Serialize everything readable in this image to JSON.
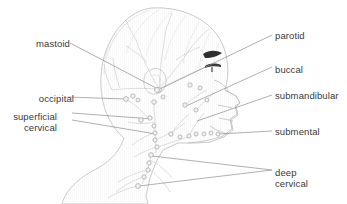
{
  "figure": {
    "background_color": "#ffffff",
    "line_color": "#b4b4b4",
    "leader_color": "#8e8e8e",
    "text_color": "#3a3a3a",
    "node_fill": "#f2f2f2",
    "node_stroke": "#a8a8a8",
    "dark_accent_color": "#2b2b2b"
  },
  "labels": {
    "left": [
      {
        "id": "mastoid",
        "text": "mastoid",
        "x": 18,
        "y": 39,
        "align": "right",
        "lines": [
          "mastoid"
        ]
      },
      {
        "id": "occipital",
        "text": "occipital",
        "x": 22,
        "y": 94,
        "align": "right",
        "lines": [
          "occipital"
        ]
      },
      {
        "id": "superficial-cervical",
        "text": "superficial cervical",
        "x": 5,
        "y": 112,
        "align": "right",
        "lines": [
          "superficial",
          "cervical"
        ]
      }
    ],
    "right": [
      {
        "id": "parotid",
        "text": "parotid",
        "x": 275,
        "y": 31,
        "align": "left",
        "lines": [
          "parotid"
        ]
      },
      {
        "id": "buccal",
        "text": "buccal",
        "x": 275,
        "y": 65,
        "align": "left",
        "lines": [
          "buccal"
        ]
      },
      {
        "id": "submandibular",
        "text": "submandibular",
        "x": 275,
        "y": 91,
        "align": "left",
        "lines": [
          "submandibular"
        ]
      },
      {
        "id": "submental",
        "text": "submental",
        "x": 275,
        "y": 127,
        "align": "left",
        "lines": [
          "submental"
        ]
      },
      {
        "id": "deep-cervical",
        "text": "deep cervical",
        "x": 275,
        "y": 168,
        "align": "left",
        "lines": [
          "deep",
          "cervical"
        ]
      }
    ]
  },
  "node_groups": [
    {
      "name": "parotid",
      "nodes": [
        {
          "cx": 159,
          "cy": 90,
          "r": 2.4
        },
        {
          "cx": 163,
          "cy": 97,
          "r": 2.0
        },
        {
          "cx": 190,
          "cy": 85,
          "r": 2.2
        },
        {
          "cx": 200,
          "cy": 88,
          "r": 2.0
        }
      ]
    },
    {
      "name": "mastoid",
      "nodes": [
        {
          "cx": 157,
          "cy": 90,
          "r": 2.5
        },
        {
          "cx": 154,
          "cy": 102,
          "r": 2.3
        }
      ]
    },
    {
      "name": "occipital",
      "nodes": [
        {
          "cx": 126,
          "cy": 99,
          "r": 2.4
        },
        {
          "cx": 133,
          "cy": 96,
          "r": 2.2
        },
        {
          "cx": 138,
          "cy": 100,
          "r": 2.0
        }
      ]
    },
    {
      "name": "superficial-cervical",
      "nodes": [
        {
          "cx": 141,
          "cy": 120,
          "r": 2.3
        },
        {
          "cx": 150,
          "cy": 118,
          "r": 2.2
        },
        {
          "cx": 154,
          "cy": 126,
          "r": 2.1
        },
        {
          "cx": 155,
          "cy": 133,
          "r": 2.1
        },
        {
          "cx": 155,
          "cy": 140,
          "r": 2.1
        },
        {
          "cx": 157,
          "cy": 147,
          "r": 2.1
        }
      ]
    },
    {
      "name": "buccal",
      "nodes": [
        {
          "cx": 185,
          "cy": 105,
          "r": 2.2
        },
        {
          "cx": 196,
          "cy": 110,
          "r": 2.1
        },
        {
          "cx": 207,
          "cy": 100,
          "r": 2.0
        }
      ]
    },
    {
      "name": "submandibular",
      "nodes": [
        {
          "cx": 171,
          "cy": 134,
          "r": 2.2
        },
        {
          "cx": 180,
          "cy": 137,
          "r": 2.1
        },
        {
          "cx": 189,
          "cy": 136,
          "r": 2.1
        },
        {
          "cx": 196,
          "cy": 134,
          "r": 2.0
        }
      ]
    },
    {
      "name": "submental",
      "nodes": [
        {
          "cx": 204,
          "cy": 134,
          "r": 2.0
        },
        {
          "cx": 211,
          "cy": 133,
          "r": 2.0
        },
        {
          "cx": 218,
          "cy": 134,
          "r": 2.0
        }
      ]
    },
    {
      "name": "deep-cervical",
      "nodes": [
        {
          "cx": 151,
          "cy": 155,
          "r": 2.3
        },
        {
          "cx": 149,
          "cy": 163,
          "r": 2.2
        },
        {
          "cx": 148,
          "cy": 170,
          "r": 2.2
        },
        {
          "cx": 144,
          "cy": 177,
          "r": 2.2
        },
        {
          "cx": 138,
          "cy": 186,
          "r": 2.4
        }
      ]
    }
  ],
  "leaders": [
    {
      "id": "mastoid-leader",
      "from_label": "mastoid",
      "path": "M 70,43 L 158,89"
    },
    {
      "id": "occipital-leader",
      "from_label": "occipital",
      "path": "M 68,97 L 125,99"
    },
    {
      "id": "superficial-cervical-leader-a",
      "from_label": "superficial-cervical",
      "path": "M 72,113 L 152,119"
    },
    {
      "id": "superficial-cervical-leader-b",
      "from_label": "superficial-cervical",
      "path": "M 72,120 L 156,134"
    },
    {
      "id": "parotid-leader",
      "from_label": "parotid",
      "path": "M 272,35 L 160,89"
    },
    {
      "id": "buccal-leader",
      "from_label": "buccal",
      "path": "M 272,67 L 186,106"
    },
    {
      "id": "submandibular-leader",
      "from_label": "submandibular",
      "path": "M 272,95 L 197,121"
    },
    {
      "id": "submental-leader",
      "from_label": "submental",
      "path": "M 272,131 L 219,134"
    },
    {
      "id": "deep-cervical-leader-a",
      "from_label": "deep-cervical",
      "path": "M 272,170 L 152,156"
    },
    {
      "id": "deep-cervical-leader-b",
      "from_label": "deep-cervical",
      "path": "M 272,170 L 139,186"
    }
  ]
}
